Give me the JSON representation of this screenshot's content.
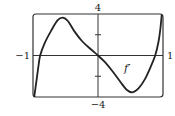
{
  "chart_data": {
    "type": "line",
    "title": "",
    "xlabel": "",
    "ylabel": "",
    "xlim": [
      -1,
      1
    ],
    "ylim": [
      -4,
      4
    ],
    "grid": false,
    "x_tick_labels": [
      {
        "value": -1,
        "label": "−1"
      },
      {
        "value": 1,
        "label": "1"
      }
    ],
    "y_tick_labels": [
      {
        "value": 4,
        "label": "4"
      },
      {
        "value": -4,
        "label": "−4"
      }
    ],
    "y_minor_ticks": [
      2,
      -2
    ],
    "series": [
      {
        "name": "f′",
        "label": "f′",
        "label_at": {
          "x": 0.45,
          "y": -1.6
        },
        "points": [
          {
            "x": -0.98,
            "y": -3.95
          },
          {
            "x": -0.95,
            "y": -2.6
          },
          {
            "x": -0.92,
            "y": -1.2
          },
          {
            "x": -0.89,
            "y": 0.0
          },
          {
            "x": -0.82,
            "y": 1.2
          },
          {
            "x": -0.72,
            "y": 2.4
          },
          {
            "x": -0.62,
            "y": 3.4
          },
          {
            "x": -0.54,
            "y": 3.65
          },
          {
            "x": -0.46,
            "y": 3.3
          },
          {
            "x": -0.36,
            "y": 2.3
          },
          {
            "x": -0.24,
            "y": 1.35
          },
          {
            "x": -0.1,
            "y": 0.55
          },
          {
            "x": 0.0,
            "y": 0.0
          },
          {
            "x": 0.1,
            "y": -0.6
          },
          {
            "x": 0.22,
            "y": -1.5
          },
          {
            "x": 0.34,
            "y": -2.5
          },
          {
            "x": 0.44,
            "y": -3.3
          },
          {
            "x": 0.53,
            "y": -3.55
          },
          {
            "x": 0.62,
            "y": -3.2
          },
          {
            "x": 0.72,
            "y": -2.3
          },
          {
            "x": 0.81,
            "y": -1.1
          },
          {
            "x": 0.88,
            "y": 0.0
          },
          {
            "x": 0.93,
            "y": 1.3
          },
          {
            "x": 0.96,
            "y": 2.6
          },
          {
            "x": 0.98,
            "y": 3.9
          }
        ]
      }
    ]
  }
}
